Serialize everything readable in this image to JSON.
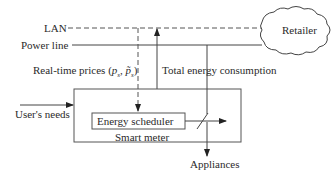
{
  "diagram": {
    "nodes": {
      "retailer": "Retailer",
      "smart_meter": "Smart meter",
      "energy_scheduler": "Energy scheduler",
      "appliances": "Appliances"
    },
    "lines": {
      "lan": "LAN",
      "power_line": "Power line"
    },
    "flows": {
      "real_time_prices_prefix": "Real-time prices (",
      "real_time_prices_p": "p",
      "real_time_prices_sub": "s",
      "real_time_prices_comma": ", ",
      "real_time_prices_ptilde": "p̃",
      "real_time_prices_sub2": "s",
      "real_time_prices_suffix": ")",
      "total_energy_consumption": "Total energy consumption",
      "users_needs": "User's needs"
    },
    "colors": {
      "line": "#444444",
      "text": "#2a2a2a"
    }
  }
}
